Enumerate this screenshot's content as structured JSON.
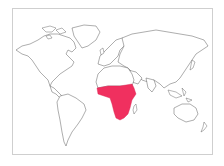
{
  "map": {
    "type": "world-outline",
    "projection": "equirectangular-like",
    "highlighted_region": {
      "name": "Sub-Saharan Africa",
      "color": "#f0305f"
    },
    "land_fill": "#ffffff",
    "outline_color": "#4a4a4a",
    "frame_color": "#cfcfcf",
    "background": "#ffffff"
  }
}
